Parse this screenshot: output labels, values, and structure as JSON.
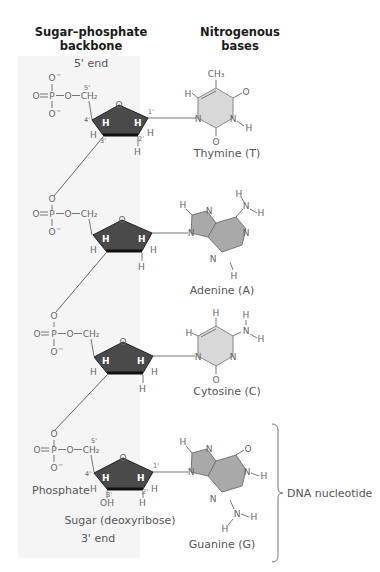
{
  "headers": {
    "backbone": [
      "Sugar–phosphate",
      "backbone"
    ],
    "bases": [
      "Nitrogenous",
      "bases"
    ]
  },
  "ends": {
    "five_prime": "5' end",
    "three_prime": "3' end"
  },
  "nucleotides": [
    {
      "base": "Thymine (T)",
      "type": "pyrimidine",
      "color": "#d8d8d8"
    },
    {
      "base": "Adenine (A)",
      "type": "purine",
      "color": "#a9a9a9"
    },
    {
      "base": "Cytosine (C)",
      "type": "pyrimidine",
      "color": "#d8d8d8"
    },
    {
      "base": "Guanine (G)",
      "type": "purine",
      "color": "#a9a9a9"
    }
  ],
  "labels": {
    "phosphate": "Phosphate",
    "sugar": "Sugar (deoxyribose)",
    "nucleotide": "DNA nucleotide"
  },
  "atoms": {
    "O": "O",
    "Ominus": "O⁻",
    "P": "P",
    "CH2": "CH₂",
    "CH3": "CH₃",
    "H": "H",
    "N": "N",
    "OH": "OH",
    "c1": "1'",
    "c2": "2'",
    "c3": "3'",
    "c4": "4'",
    "c5": "5'"
  },
  "colors": {
    "sugar_fill": "#4a4a4a",
    "sugar_edge": "#111111",
    "pyrimidine_fill": "#d8d8d8",
    "purine_fill": "#a9a9a9",
    "backbone_band": "#f4f4f4"
  }
}
